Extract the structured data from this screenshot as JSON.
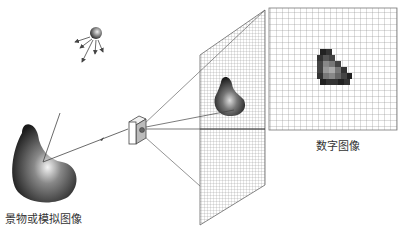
{
  "labels": {
    "scene": "景物或模拟图像",
    "digital": "数字图像"
  },
  "elements": {
    "light_source": "light-source",
    "scene_object": "scene-object",
    "camera": "camera",
    "image_plane": "sensor-grid-plane",
    "digital_grid": "digital-image-grid"
  },
  "colors": {
    "line": "#444444",
    "grid": "#999999",
    "blob_dark": "#222222",
    "blob_light": "#eeeeee"
  }
}
